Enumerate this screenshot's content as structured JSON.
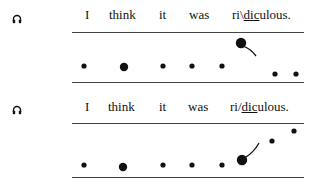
{
  "figure": {
    "type": "intonation contour diagram",
    "rows": [
      {
        "contour": "fall",
        "words": [
          "I",
          "think",
          "it",
          "was"
        ],
        "final_word": {
          "pre": "ri\\",
          "stressed": "dic",
          "post": "ulous."
        },
        "icon": "headphones-icon"
      },
      {
        "contour": "rise",
        "words": [
          "I",
          "think",
          "it",
          "was"
        ],
        "final_word": {
          "pre": "ri/",
          "stressed": "dic",
          "post": "ulous."
        },
        "icon": "headphones-icon"
      }
    ]
  }
}
